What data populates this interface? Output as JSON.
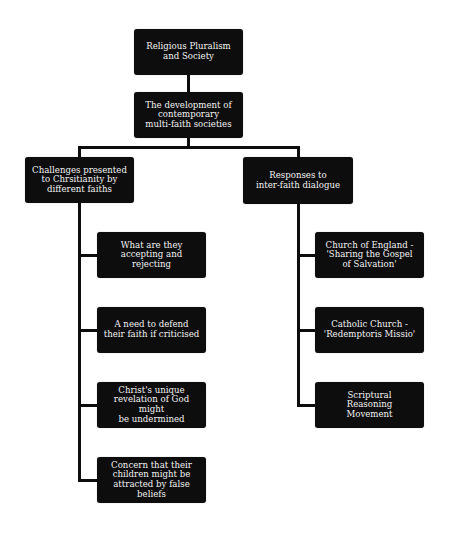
{
  "diagram": {
    "type": "hierarchy",
    "colors": {
      "node_fill": "#0d0d0d",
      "node_text": "#f2f2f2",
      "connector": "#0d0d0d",
      "background": "#ffffff"
    },
    "root": {
      "label": "Religious Pluralism\nand Society"
    },
    "level1": {
      "label": "The development of\ncontemporary\nmulti-faith societies"
    },
    "left_branch": {
      "label": "Challenges presented\nto Chrsitianity by\ndifferent faiths",
      "children": [
        {
          "label": "What are they\naccepting and\nrejecting"
        },
        {
          "label": "A need to defend\ntheir faith if criticised"
        },
        {
          "label": "Christ's unique\nrevelation of God might\nbe undermined"
        },
        {
          "label": "Concern that their\nchildren might be\nattracted by false beliefs"
        }
      ]
    },
    "right_branch": {
      "label": "Responses to\ninter-faith dialogue",
      "children": [
        {
          "label": "Church of England -\n'Sharing the Gospel\nof Salvation'"
        },
        {
          "label": "Catholic Church -\n'Redemptoris Missio'"
        },
        {
          "label": "Scriptural\nReasoning\nMovement"
        }
      ]
    }
  }
}
